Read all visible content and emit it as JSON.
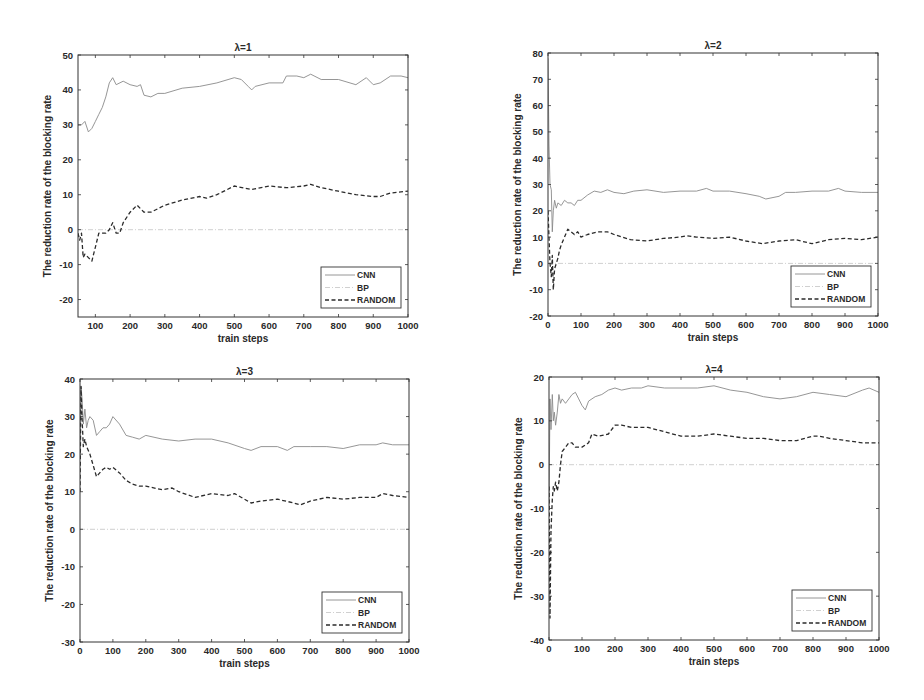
{
  "figure": {
    "ylabel": "The reduction rate of the blocking rate",
    "xlabel": "train steps",
    "legend": [
      "CNN",
      "BP",
      "RANDOM"
    ],
    "colors": {
      "CNN": "#8a8a8a",
      "BP": "#c4c4c4",
      "RANDOM": "#2b2b2b",
      "axes": "#333333"
    }
  },
  "chart_data": [
    {
      "type": "line",
      "title": "λ=1",
      "xlabel": "train steps",
      "ylabel": "The reduction rate of the blocking rate",
      "xlim": [
        50,
        1000
      ],
      "ylim": [
        -25,
        50
      ],
      "xticks": [
        100,
        200,
        300,
        400,
        500,
        600,
        700,
        800,
        900,
        1000
      ],
      "yticks": [
        -20,
        -10,
        0,
        10,
        20,
        30,
        40,
        50
      ],
      "legend_position": "lower right",
      "box": {
        "left": 78,
        "top": 55,
        "right": 408,
        "bottom": 317
      },
      "series": [
        {
          "name": "CNN",
          "style": "solid",
          "x": [
            50,
            60,
            70,
            80,
            90,
            100,
            110,
            120,
            130,
            140,
            150,
            160,
            180,
            200,
            220,
            230,
            240,
            260,
            280,
            300,
            350,
            400,
            450,
            500,
            520,
            540,
            550,
            560,
            600,
            640,
            650,
            680,
            700,
            720,
            750,
            800,
            850,
            880,
            900,
            920,
            950,
            980,
            1000
          ],
          "y": [
            30,
            30,
            31,
            28,
            29,
            31,
            33,
            35,
            38,
            42,
            43.5,
            41.5,
            42.5,
            41.5,
            41,
            41.5,
            38.5,
            38,
            39,
            39,
            40.5,
            41,
            42,
            43.5,
            43,
            41,
            40,
            41,
            42,
            42,
            44,
            44,
            43.5,
            44.5,
            43,
            43,
            41.5,
            43.5,
            41.5,
            42,
            44,
            44,
            43.5
          ]
        },
        {
          "name": "BP",
          "style": "dashdot",
          "x": [
            50,
            1000
          ],
          "y": [
            0,
            0
          ]
        },
        {
          "name": "RANDOM",
          "style": "dashed",
          "x": [
            50,
            55,
            60,
            65,
            70,
            80,
            90,
            95,
            100,
            110,
            120,
            130,
            140,
            150,
            160,
            170,
            180,
            200,
            220,
            240,
            260,
            280,
            300,
            350,
            400,
            420,
            450,
            500,
            550,
            600,
            650,
            700,
            720,
            750,
            800,
            850,
            900,
            920,
            950,
            1000
          ],
          "y": [
            -1,
            -3,
            -1,
            -8,
            -7,
            -8,
            -9,
            -7,
            -5,
            -1,
            -1,
            -1,
            0,
            2,
            -1,
            -1,
            2,
            5,
            7,
            5,
            5,
            6,
            7,
            8.5,
            9.5,
            9,
            10,
            12.5,
            11.5,
            12.5,
            12,
            12.5,
            13,
            12,
            11,
            10,
            9.5,
            9.5,
            10.5,
            11
          ]
        }
      ]
    },
    {
      "type": "line",
      "title": "λ=2",
      "xlabel": "train steps",
      "ylabel": "The reduction rate of the blocking rate",
      "xlim": [
        0,
        1000
      ],
      "ylim": [
        -20,
        80
      ],
      "xticks": [
        0,
        100,
        200,
        300,
        400,
        500,
        600,
        700,
        800,
        900,
        1000
      ],
      "yticks": [
        -20,
        -10,
        0,
        10,
        20,
        30,
        40,
        50,
        60,
        70,
        80
      ],
      "legend_position": "lower right",
      "box": {
        "left": 548,
        "top": 53,
        "right": 878,
        "bottom": 316
      },
      "series": [
        {
          "name": "CNN",
          "style": "solid",
          "x": [
            0,
            3,
            6,
            10,
            13,
            16,
            20,
            25,
            30,
            40,
            50,
            60,
            70,
            80,
            90,
            100,
            120,
            140,
            160,
            180,
            200,
            230,
            260,
            300,
            350,
            400,
            450,
            480,
            500,
            550,
            600,
            640,
            660,
            700,
            720,
            750,
            800,
            850,
            880,
            900,
            950,
            1000
          ],
          "y": [
            78,
            45,
            30,
            28,
            12,
            20,
            24,
            21,
            23,
            22,
            24,
            23,
            23,
            22,
            24,
            24,
            26,
            27.5,
            27,
            28,
            27,
            26.5,
            27.5,
            28,
            27,
            27.5,
            27.5,
            28.5,
            27.5,
            27.5,
            26.5,
            25.5,
            24.5,
            25.5,
            27,
            27,
            27.5,
            27.5,
            28.5,
            27.5,
            27,
            27
          ]
        },
        {
          "name": "BP",
          "style": "dashdot",
          "x": [
            0,
            1000
          ],
          "y": [
            0,
            0
          ]
        },
        {
          "name": "RANDOM",
          "style": "dashed",
          "x": [
            0,
            3,
            6,
            10,
            13,
            16,
            20,
            25,
            30,
            35,
            40,
            50,
            60,
            70,
            80,
            90,
            100,
            120,
            150,
            180,
            200,
            250,
            300,
            350,
            400,
            420,
            450,
            500,
            550,
            600,
            650,
            700,
            750,
            800,
            850,
            900,
            950,
            1000
          ],
          "y": [
            20,
            10,
            0,
            -5,
            3,
            -10,
            -2,
            0,
            2,
            5,
            7,
            10,
            13,
            12,
            11,
            12,
            10,
            11,
            12,
            12,
            11,
            9,
            8.5,
            9.5,
            10,
            10.5,
            10,
            9.5,
            10,
            8.5,
            7.5,
            8.5,
            9,
            7.5,
            9,
            9.5,
            9,
            10
          ]
        }
      ]
    },
    {
      "type": "line",
      "title": "λ=3",
      "xlabel": "train steps",
      "ylabel": "The reduction rate of the blocking rate",
      "xlim": [
        0,
        1000
      ],
      "ylim": [
        -30,
        40
      ],
      "xticks": [
        0,
        100,
        200,
        300,
        400,
        500,
        600,
        700,
        800,
        900,
        1000
      ],
      "yticks": [
        -30,
        -20,
        -10,
        0,
        10,
        20,
        30,
        40
      ],
      "legend_position": "lower right",
      "box": {
        "left": 80,
        "top": 379,
        "right": 409,
        "bottom": 642
      },
      "series": [
        {
          "name": "CNN",
          "style": "solid",
          "x": [
            0,
            3,
            6,
            10,
            15,
            20,
            25,
            30,
            40,
            50,
            60,
            70,
            80,
            90,
            100,
            120,
            140,
            160,
            180,
            200,
            250,
            300,
            350,
            400,
            450,
            500,
            520,
            550,
            600,
            630,
            650,
            700,
            750,
            800,
            850,
            900,
            920,
            950,
            1000
          ],
          "y": [
            20,
            38,
            35,
            28,
            32,
            27,
            29,
            30,
            29,
            25,
            26,
            27,
            27,
            28,
            30,
            28,
            25,
            24.5,
            24,
            25,
            24,
            23.5,
            24,
            24,
            23,
            21.5,
            21,
            22,
            22,
            21,
            22,
            22,
            22,
            21.5,
            22.5,
            22.5,
            23,
            22.5,
            22.5
          ]
        },
        {
          "name": "BP",
          "style": "dashdot",
          "x": [
            0,
            1000
          ],
          "y": [
            0,
            0
          ]
        },
        {
          "name": "RANDOM",
          "style": "dashed",
          "x": [
            0,
            3,
            6,
            10,
            15,
            20,
            30,
            40,
            50,
            60,
            70,
            80,
            90,
            100,
            120,
            140,
            160,
            180,
            200,
            250,
            280,
            300,
            350,
            400,
            450,
            470,
            500,
            520,
            550,
            600,
            650,
            670,
            700,
            750,
            800,
            850,
            900,
            920,
            950,
            1000
          ],
          "y": [
            10,
            38,
            30,
            22,
            24,
            22,
            20,
            17,
            14,
            15,
            16,
            16.5,
            16,
            16.5,
            15,
            13,
            12,
            11.5,
            11.5,
            10.5,
            11,
            10,
            8.5,
            9.5,
            9,
            9.5,
            8,
            7,
            7.5,
            8,
            7,
            6.5,
            7.5,
            8.5,
            8,
            8.5,
            8.5,
            9.5,
            9,
            8.5
          ]
        }
      ]
    },
    {
      "type": "line",
      "title": "λ=4",
      "xlabel": "train steps",
      "ylabel": "The reduction rate of the blocking rate",
      "xlim": [
        0,
        1000
      ],
      "ylim": [
        -40,
        20
      ],
      "xticks": [
        0,
        100,
        200,
        300,
        400,
        500,
        600,
        700,
        800,
        900,
        1000
      ],
      "yticks": [
        -40,
        -30,
        -20,
        -10,
        0,
        10,
        20
      ],
      "legend_position": "lower right",
      "box": {
        "left": 549,
        "top": 377,
        "right": 879,
        "bottom": 640
      },
      "series": [
        {
          "name": "CNN",
          "style": "solid",
          "x": [
            0,
            3,
            6,
            10,
            13,
            16,
            20,
            25,
            30,
            35,
            40,
            50,
            60,
            70,
            80,
            90,
            100,
            110,
            120,
            140,
            160,
            180,
            200,
            220,
            250,
            280,
            300,
            350,
            400,
            450,
            500,
            550,
            600,
            650,
            700,
            750,
            800,
            850,
            900,
            950,
            970,
            1000
          ],
          "y": [
            -10,
            15,
            8,
            16,
            10,
            12,
            9,
            12,
            16,
            14,
            15,
            14,
            15,
            16,
            16.5,
            15,
            13.5,
            12.5,
            14.5,
            15.5,
            16,
            17,
            17.5,
            17,
            17.5,
            17.5,
            18,
            17.5,
            17.5,
            17.5,
            18,
            17,
            16.5,
            15.5,
            15,
            15.5,
            16.5,
            16,
            15.5,
            17,
            17.5,
            16.5
          ]
        },
        {
          "name": "BP",
          "style": "dashdot",
          "x": [
            0,
            1000
          ],
          "y": [
            0,
            0
          ]
        },
        {
          "name": "RANDOM",
          "style": "dashed",
          "x": [
            0,
            3,
            6,
            10,
            13,
            16,
            20,
            25,
            30,
            35,
            40,
            50,
            60,
            70,
            80,
            90,
            100,
            120,
            130,
            150,
            180,
            200,
            220,
            250,
            280,
            300,
            350,
            400,
            450,
            500,
            550,
            600,
            650,
            700,
            750,
            800,
            820,
            850,
            900,
            950,
            1000
          ],
          "y": [
            -5,
            -35,
            -15,
            -8,
            -5,
            -6,
            -4,
            -6,
            -4,
            0,
            3,
            4,
            5,
            5,
            4,
            4,
            4,
            5,
            7,
            6.5,
            7,
            9,
            9,
            8.5,
            8.5,
            8.5,
            7.5,
            6.5,
            6.5,
            7,
            6.5,
            6,
            6,
            5.5,
            5.5,
            6.5,
            6.5,
            6,
            5.5,
            5,
            5
          ]
        }
      ]
    }
  ]
}
